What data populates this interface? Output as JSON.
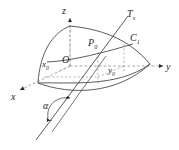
{
  "figure": {
    "kind": "3d-geometry-diagram",
    "background_color": "#ffffff",
    "stroke_color": "#3a3a3a",
    "dashed_color": "#8a8a8a",
    "label_color": "#262626",
    "axes": [
      {
        "id": "z",
        "label": "z",
        "sub": "",
        "direction": "up",
        "style": "dashed-with-arrow"
      },
      {
        "id": "y",
        "label": "y",
        "sub": "",
        "direction": "right",
        "style": "dashed-with-arrow"
      },
      {
        "id": "x",
        "label": "x",
        "sub": "",
        "direction": "down-left",
        "style": "dashed-with-arrow"
      }
    ],
    "points": [
      {
        "id": "origin",
        "label": "O",
        "sub": "",
        "x": 70,
        "y": 66
      },
      {
        "id": "p0",
        "label": "P",
        "sub": "0",
        "x": 98,
        "y": 52
      },
      {
        "id": "c1",
        "label": "C",
        "sub": "1",
        "x": 124,
        "y": 44
      }
    ],
    "coordinate_marks": [
      {
        "id": "x0",
        "label": "x",
        "sub": "0",
        "x": 46,
        "y": 66
      },
      {
        "id": "y0",
        "label": "y",
        "sub": "0",
        "x": 113,
        "y": 66
      }
    ],
    "tangent_line": {
      "id": "Ts",
      "label": "T",
      "sub": "s"
    },
    "angle": {
      "id": "alpha",
      "label": "α",
      "sub": ""
    },
    "surface": {
      "id": "surface-patch",
      "description": "curved quadrilateral surface patch"
    }
  }
}
